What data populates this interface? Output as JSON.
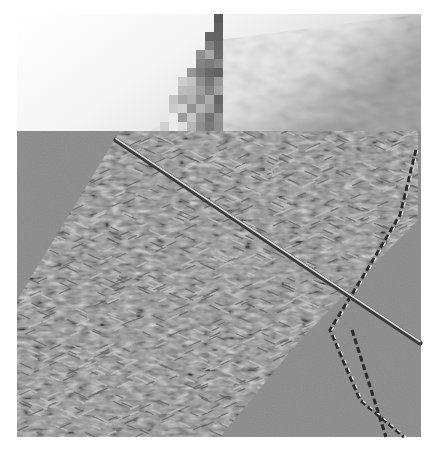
{
  "image": {
    "width": 439,
    "height": 452,
    "background": "#ffffff",
    "subject": "filtered texture image of knitted fabric with a knitting needle and yarn strand",
    "text": []
  },
  "regions": {
    "top_photo": {
      "x": 17,
      "y": 14,
      "w": 404,
      "h": 117,
      "light": "#f2f2f2",
      "mid": "#c8c8c8",
      "dark": "#5a5a5a"
    },
    "mosaic_block": {
      "x": 160,
      "y": 14,
      "w": 58,
      "h": 117,
      "cell": 9
    },
    "gray_panel": {
      "x": 17,
      "y": 131,
      "w": 404,
      "h": 306,
      "base": "#8a8a8a",
      "texture_light": "#c4c4c4",
      "texture_dark": "#5e5e5e"
    },
    "needle": {
      "x1": 116,
      "y1": 140,
      "x2": 420,
      "y2": 343,
      "color_dark": "#3a3a3a",
      "color_light": "#d8d8d8"
    },
    "yarn_strand": {
      "points": [
        [
          416,
          150
        ],
        [
          400,
          215
        ],
        [
          370,
          265
        ],
        [
          330,
          330
        ],
        [
          360,
          400
        ],
        [
          404,
          437
        ]
      ],
      "color": "#2a2a2a"
    },
    "yarn_strand_2": {
      "points": [
        [
          352,
          330
        ],
        [
          368,
          380
        ],
        [
          386,
          437
        ]
      ],
      "color": "#2a2a2a"
    },
    "fabric_band": {
      "description": "diagonal knitted band from upper-right to lower-left",
      "polygon": [
        [
          120,
          131
        ],
        [
          418,
          131
        ],
        [
          418,
          220
        ],
        [
          300,
          340
        ],
        [
          220,
          437
        ],
        [
          17,
          437
        ],
        [
          17,
          300
        ]
      ]
    }
  }
}
